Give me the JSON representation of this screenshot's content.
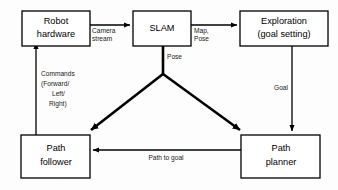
{
  "diagram": {
    "background_color": "#fdfdfd",
    "line_color": "#000000",
    "box_fill": "#ffffff",
    "nodes": [
      {
        "id": "robot-hardware",
        "label_line1": "Robot",
        "label_line2": "hardware"
      },
      {
        "id": "slam",
        "label_line1": "SLAM",
        "label_line2": ""
      },
      {
        "id": "exploration",
        "label_line1": "Exploration",
        "label_line2": "(goal setting)"
      },
      {
        "id": "path-follower",
        "label_line1": "Path",
        "label_line2": "follower"
      },
      {
        "id": "path-planner",
        "label_line1": "Path",
        "label_line2": "planner"
      }
    ],
    "edges": [
      {
        "id": "robot-to-slam",
        "from": "robot-hardware",
        "to": "slam",
        "label_line1": "Camera",
        "label_line2": "stream"
      },
      {
        "id": "slam-to-exploration",
        "from": "slam",
        "to": "exploration",
        "label_line1": "Map,",
        "label_line2": "Pose"
      },
      {
        "id": "slam-pose-fork",
        "from": "slam",
        "to": "path-follower and path-planner",
        "label_line1": "Pose",
        "label_line2": ""
      },
      {
        "id": "exploration-to-path-planner",
        "from": "exploration",
        "to": "path-planner",
        "label_line1": "Goal",
        "label_line2": ""
      },
      {
        "id": "path-planner-to-path-follower",
        "from": "path-planner",
        "to": "path-follower",
        "label_line1": "Path to goal",
        "label_line2": ""
      },
      {
        "id": "path-follower-to-robot",
        "from": "path-follower",
        "to": "robot-hardware",
        "label_line1": "Commands",
        "label_line2": "(Forward/",
        "label_line3": "Left/",
        "label_line4": "Right)"
      }
    ]
  }
}
